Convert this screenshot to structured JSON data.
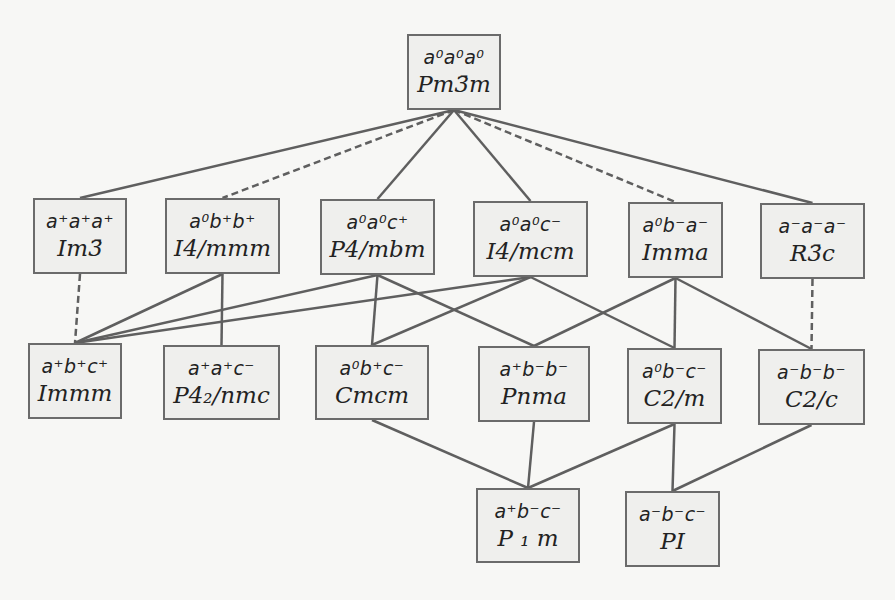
{
  "diagram": {
    "type": "hierarchy",
    "colors": {
      "box_fill": "#efefed",
      "box_border": "#6b6b6b",
      "line": "#5f5f5f",
      "background": "#f7f7f5"
    },
    "nodes": [
      {
        "id": "n0",
        "tilt": "a⁰a⁰a⁰",
        "group": "Pm3̄m",
        "x": 407,
        "y": 34,
        "w": 94,
        "h": 76
      },
      {
        "id": "n1",
        "tilt": "a⁺a⁺a⁺",
        "group": "Im3̄",
        "x": 33,
        "y": 198,
        "w": 94,
        "h": 76
      },
      {
        "id": "n2",
        "tilt": "a⁰b⁺b⁺",
        "group": "I4/mmm",
        "x": 165,
        "y": 198,
        "w": 115,
        "h": 76
      },
      {
        "id": "n3",
        "tilt": "a⁰a⁰c⁺",
        "group": "P4/mbm",
        "x": 320,
        "y": 199,
        "w": 115,
        "h": 76
      },
      {
        "id": "n4",
        "tilt": "a⁰a⁰c⁻",
        "group": "I4/mcm",
        "x": 473,
        "y": 201,
        "w": 115,
        "h": 76
      },
      {
        "id": "n5",
        "tilt": "a⁰b⁻a⁻",
        "group": "Imma",
        "x": 628,
        "y": 202,
        "w": 95,
        "h": 76
      },
      {
        "id": "n6",
        "tilt": "a⁻a⁻a⁻",
        "group": "R3̄c",
        "x": 760,
        "y": 203,
        "w": 105,
        "h": 76
      },
      {
        "id": "n7",
        "tilt": "a⁺b⁺c⁺",
        "group": "Immm",
        "x": 28,
        "y": 343,
        "w": 94,
        "h": 76
      },
      {
        "id": "n8",
        "tilt": "a⁺a⁺c⁻",
        "group": "P4₂/nmc",
        "x": 163,
        "y": 345,
        "w": 117,
        "h": 75
      },
      {
        "id": "n9",
        "tilt": "a⁰b⁺c⁻",
        "group": "Cmcm",
        "x": 315,
        "y": 345,
        "w": 114,
        "h": 75
      },
      {
        "id": "n10",
        "tilt": "a⁺b⁻b⁻",
        "group": "Pnma",
        "x": 478,
        "y": 346,
        "w": 112,
        "h": 76
      },
      {
        "id": "n11",
        "tilt": "a⁰b⁻c⁻",
        "group": "C2/m",
        "x": 627,
        "y": 348,
        "w": 95,
        "h": 76
      },
      {
        "id": "n12",
        "tilt": "a⁻b⁻b⁻",
        "group": "C2/c",
        "x": 758,
        "y": 349,
        "w": 107,
        "h": 76
      },
      {
        "id": "n13",
        "tilt": "a⁺b⁻c⁻",
        "group": "P ₁ m",
        "x": 476,
        "y": 488,
        "w": 104,
        "h": 75
      },
      {
        "id": "n14",
        "tilt": "a⁻b⁻c⁻",
        "group": "PI",
        "x": 625,
        "y": 491,
        "w": 95,
        "h": 76
      }
    ],
    "edges": [
      {
        "from": "n0",
        "to": "n1",
        "style": "solid"
      },
      {
        "from": "n0",
        "to": "n2",
        "style": "dashed"
      },
      {
        "from": "n0",
        "to": "n3",
        "style": "solid"
      },
      {
        "from": "n0",
        "to": "n4",
        "style": "solid"
      },
      {
        "from": "n0",
        "to": "n5",
        "style": "dashed"
      },
      {
        "from": "n0",
        "to": "n6",
        "style": "solid"
      },
      {
        "from": "n1",
        "to": "n7",
        "style": "dashed"
      },
      {
        "from": "n2",
        "to": "n7",
        "style": "solid"
      },
      {
        "from": "n2",
        "to": "n8",
        "style": "solid"
      },
      {
        "from": "n3",
        "to": "n7",
        "style": "solid"
      },
      {
        "from": "n3",
        "to": "n9",
        "style": "solid"
      },
      {
        "from": "n3",
        "to": "n10",
        "style": "solid"
      },
      {
        "from": "n4",
        "to": "n7",
        "style": "solid"
      },
      {
        "from": "n4",
        "to": "n9",
        "style": "solid"
      },
      {
        "from": "n4",
        "to": "n11",
        "style": "solid"
      },
      {
        "from": "n5",
        "to": "n10",
        "style": "solid"
      },
      {
        "from": "n5",
        "to": "n11",
        "style": "solid"
      },
      {
        "from": "n5",
        "to": "n12",
        "style": "solid"
      },
      {
        "from": "n6",
        "to": "n12",
        "style": "dashed"
      },
      {
        "from": "n9",
        "to": "n13",
        "style": "solid"
      },
      {
        "from": "n10",
        "to": "n13",
        "style": "solid"
      },
      {
        "from": "n11",
        "to": "n13",
        "style": "solid"
      },
      {
        "from": "n11",
        "to": "n14",
        "style": "solid"
      },
      {
        "from": "n12",
        "to": "n14",
        "style": "solid"
      }
    ]
  }
}
